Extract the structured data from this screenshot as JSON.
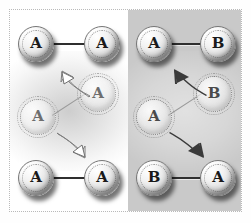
{
  "figure": {
    "panel_divider_x": 128,
    "colors": {
      "left_panel_background": "#ffffff",
      "right_panel_background": "#c9c9c9",
      "atom_fill": "#f2f2f2",
      "atom_outline": "#777777",
      "bond": "#2f2f2f",
      "ghost_outline": "#8d8d8d",
      "arrow_left": "#ffffff",
      "arrow_right": "#3a3a3a",
      "frame": "#b9b9b9"
    }
  },
  "panels": [
    {
      "id": "left",
      "name": "homonuclear-panel",
      "background_label": "white",
      "arrow_style": "white-filled-outlined",
      "states": [
        {
          "id": "left-top",
          "name": "initial-state",
          "position": "top",
          "rendering": "solid",
          "orientation_degrees": 0,
          "atoms": [
            {
              "label": "A",
              "role": "left-atom"
            },
            {
              "label": "A",
              "role": "right-atom"
            }
          ]
        },
        {
          "id": "left-middle",
          "name": "transition-state",
          "position": "middle",
          "rendering": "ghost",
          "orientation_degrees": -35,
          "atoms": [
            {
              "label": "A",
              "role": "lower-left-atom"
            },
            {
              "label": "A",
              "role": "upper-right-atom"
            }
          ]
        },
        {
          "id": "left-bottom",
          "name": "final-state",
          "position": "bottom",
          "rendering": "solid",
          "orientation_degrees": 0,
          "atoms": [
            {
              "label": "A",
              "role": "left-atom"
            },
            {
              "label": "A",
              "role": "right-atom"
            }
          ]
        }
      ],
      "arrows": [
        {
          "id": "left-arrow-up",
          "name": "rotation-arrow-upper",
          "direction": "up-left",
          "fill": "white"
        },
        {
          "id": "left-arrow-down",
          "name": "rotation-arrow-lower",
          "direction": "down-right",
          "fill": "white"
        }
      ]
    },
    {
      "id": "right",
      "name": "heteronuclear-panel",
      "background_label": "gray",
      "arrow_style": "dark-filled",
      "states": [
        {
          "id": "right-top",
          "name": "initial-state",
          "position": "top",
          "rendering": "solid",
          "orientation_degrees": 0,
          "atoms": [
            {
              "label": "A",
              "role": "left-atom"
            },
            {
              "label": "B",
              "role": "right-atom"
            }
          ]
        },
        {
          "id": "right-middle",
          "name": "transition-state",
          "position": "middle",
          "rendering": "ghost",
          "orientation_degrees": -35,
          "atoms": [
            {
              "label": "A",
              "role": "lower-left-atom"
            },
            {
              "label": "B",
              "role": "upper-right-atom"
            }
          ]
        },
        {
          "id": "right-bottom",
          "name": "final-state",
          "position": "bottom",
          "rendering": "solid",
          "orientation_degrees": 0,
          "atoms": [
            {
              "label": "B",
              "role": "left-atom"
            },
            {
              "label": "A",
              "role": "right-atom"
            }
          ]
        }
      ],
      "arrows": [
        {
          "id": "right-arrow-up",
          "name": "rotation-arrow-upper",
          "direction": "up-left",
          "fill": "dark"
        },
        {
          "id": "right-arrow-down",
          "name": "rotation-arrow-lower",
          "direction": "down-right",
          "fill": "dark"
        }
      ]
    }
  ]
}
